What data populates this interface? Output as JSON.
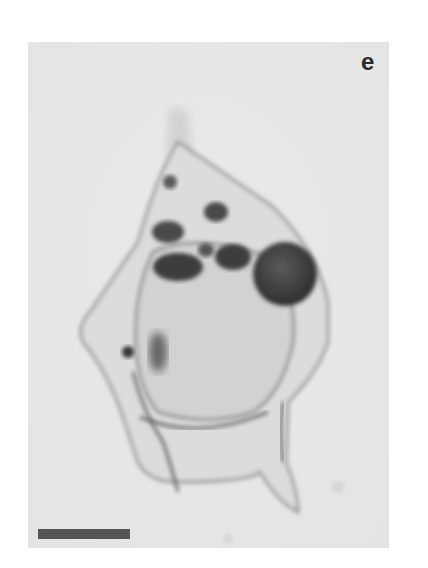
{
  "figure": {
    "panel_label": "e",
    "colors": {
      "background": "#e9e9e9",
      "scale_bar": "#555555",
      "label": "#2a2a2a"
    }
  }
}
